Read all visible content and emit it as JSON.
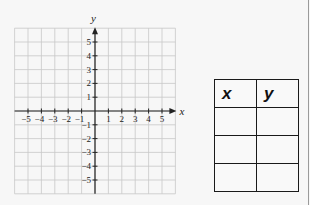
{
  "graph": {
    "x_axis_label": "x",
    "y_axis_label": "y",
    "x_range": [
      -6,
      6
    ],
    "y_range": [
      -6,
      6
    ],
    "x_ticks": [
      -5,
      -4,
      -3,
      -2,
      -1,
      1,
      2,
      3,
      4,
      5
    ],
    "y_ticks": [
      5,
      4,
      3,
      2,
      1,
      -1,
      -2,
      -3,
      -4,
      -5
    ],
    "x_tick_labels": [
      "−5",
      "−4",
      "−3",
      "−2",
      "−1",
      "1",
      "2",
      "3",
      "4",
      "5"
    ],
    "y_tick_labels": [
      "5",
      "4",
      "3",
      "2",
      "1",
      "−1",
      "−2",
      "−3",
      "−4",
      "−5"
    ],
    "grid": true,
    "colors": {
      "grid": "#c8c8c8",
      "axis": "#222222",
      "text": "#222222"
    }
  },
  "table": {
    "headers": [
      "x",
      "y"
    ],
    "rows": [
      [
        "",
        ""
      ],
      [
        "",
        ""
      ],
      [
        "",
        ""
      ]
    ]
  }
}
